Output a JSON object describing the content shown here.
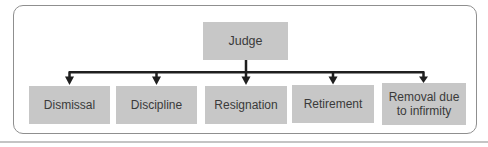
{
  "figure": {
    "type": "flowchart",
    "root": {
      "label": "Judge"
    },
    "children": [
      {
        "label": "Dismissal"
      },
      {
        "label": "Discipline"
      },
      {
        "label": "Resignation"
      },
      {
        "label": "Retirement"
      },
      {
        "label": "Removal due to infirmity"
      }
    ]
  },
  "colors": {
    "background": "#ffffff",
    "box_fill": "#c7c7c7",
    "box_text": "#3a3a3a",
    "connector": "#1f1f1f",
    "frame_border": "#8f8f8f",
    "page_rule": "#c4c4c4"
  }
}
